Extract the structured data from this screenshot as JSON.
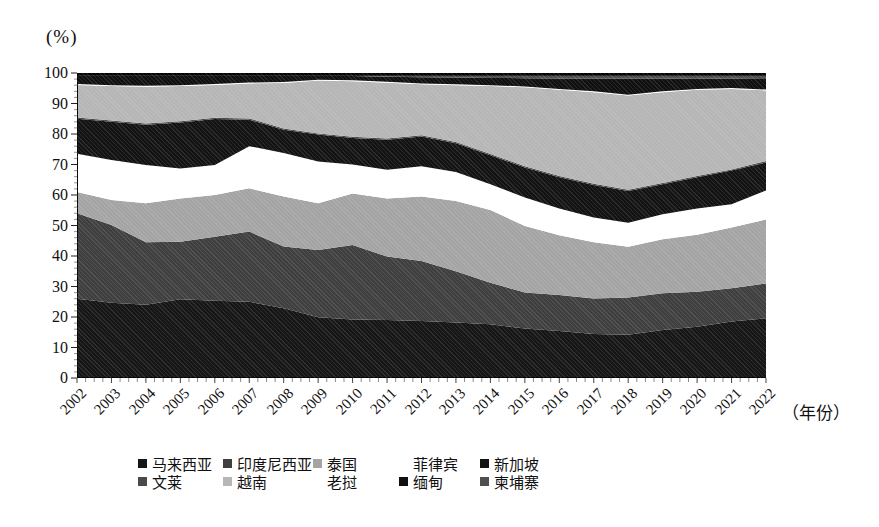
{
  "axis": {
    "y_title": "(%)",
    "x_title": "（年份）",
    "y_ticks": [
      0,
      10,
      20,
      30,
      40,
      50,
      60,
      70,
      80,
      90,
      100
    ],
    "x_ticks": [
      "2002",
      "2003",
      "2004",
      "2005",
      "2006",
      "2007",
      "2008",
      "2009",
      "2010",
      "2011",
      "2012",
      "2013",
      "2014",
      "2015",
      "2016",
      "2017",
      "2018",
      "2019",
      "2020",
      "2021",
      "2022"
    ]
  },
  "legend": {
    "rows": [
      [
        "malaysia",
        "indonesia",
        "thailand",
        "philippines",
        "singapore"
      ],
      [
        "brunei",
        "vietnam",
        "laos",
        "myanmar",
        "cambodia"
      ]
    ]
  },
  "chart_data": {
    "type": "area",
    "stacked": true,
    "stack_total": 100,
    "title": "",
    "xlabel": "（年份）",
    "ylabel": "(%)",
    "ylim": [
      0,
      100
    ],
    "grid": false,
    "legend_position": "bottom",
    "x": [
      2002,
      2003,
      2004,
      2005,
      2006,
      2007,
      2008,
      2009,
      2010,
      2011,
      2012,
      2013,
      2014,
      2015,
      2016,
      2017,
      2018,
      2019,
      2020,
      2021,
      2022
    ],
    "series": [
      {
        "id": "malaysia",
        "name": "马来西亚",
        "color": "#161616",
        "values": [
          26.0,
          24.7,
          24.0,
          25.8,
          25.3,
          25.0,
          22.9,
          19.9,
          19.2,
          19.0,
          18.7,
          18.2,
          17.6,
          16.2,
          15.4,
          14.4,
          14.2,
          15.7,
          16.8,
          18.5,
          19.6
        ]
      },
      {
        "id": "indonesia",
        "name": "印度尼西亚",
        "color": "#3f3f3f",
        "values": [
          28.0,
          25.5,
          20.5,
          18.9,
          21.0,
          23.0,
          20.2,
          22.1,
          24.4,
          20.8,
          19.7,
          16.8,
          13.6,
          11.8,
          11.8,
          11.7,
          12.2,
          12.1,
          11.5,
          10.9,
          11.4
        ]
      },
      {
        "id": "thailand",
        "name": "泰国",
        "color": "#a4a4a4",
        "values": [
          7.0,
          8.2,
          12.8,
          14.2,
          13.7,
          14.2,
          16.4,
          15.3,
          16.9,
          19.1,
          21.1,
          23.0,
          23.9,
          21.8,
          19.6,
          18.4,
          16.6,
          17.7,
          18.7,
          19.9,
          21.0
        ]
      },
      {
        "id": "philippines",
        "name": "菲律宾",
        "color": "#ffffff",
        "values": [
          12.5,
          13.1,
          12.5,
          9.8,
          9.8,
          13.8,
          14.3,
          13.7,
          9.5,
          9.4,
          9.9,
          9.5,
          8.4,
          9.4,
          8.8,
          8.1,
          7.9,
          8.2,
          8.6,
          7.7,
          9.5
        ]
      },
      {
        "id": "singapore",
        "name": "新加坡",
        "color": "#131313",
        "values": [
          11.5,
          12.5,
          13.2,
          15.1,
          15.1,
          8.7,
          7.6,
          8.8,
          8.7,
          9.8,
          9.8,
          9.5,
          9.5,
          9.8,
          10.2,
          10.7,
          10.4,
          9.8,
          10.2,
          11.0,
          9.2
        ]
      },
      {
        "id": "brunei",
        "name": "文莱",
        "color": "#4a4a4a",
        "values": [
          0.4,
          0.4,
          0.4,
          0.4,
          0.4,
          0.4,
          0.4,
          0.4,
          0.4,
          0.4,
          0.4,
          0.4,
          0.4,
          0.4,
          0.4,
          0.4,
          0.4,
          0.4,
          0.4,
          0.4,
          0.4
        ]
      },
      {
        "id": "vietnam",
        "name": "越南",
        "color": "#b6b6b6",
        "values": [
          10.7,
          11.3,
          12.1,
          11.5,
          10.8,
          11.5,
          14.9,
          17.3,
          18.2,
          18.3,
          16.7,
          18.6,
          22.3,
          25.9,
          28.3,
          30.0,
          30.9,
          29.8,
          28.3,
          26.4,
          23.2
        ]
      },
      {
        "id": "laos",
        "name": "老挝",
        "color": "#ffffff",
        "values": [
          0.3,
          0.3,
          0.3,
          0.3,
          0.3,
          0.3,
          0.3,
          0.3,
          0.3,
          0.3,
          0.3,
          0.3,
          0.3,
          0.3,
          0.3,
          0.3,
          0.3,
          0.3,
          0.3,
          0.3,
          0.3
        ]
      },
      {
        "id": "myanmar",
        "name": "缅甸",
        "color": "#101010",
        "values": [
          2.6,
          3.0,
          3.2,
          3.0,
          2.6,
          2.1,
          2.0,
          1.2,
          1.4,
          1.7,
          2.0,
          2.2,
          2.4,
          2.7,
          3.4,
          4.2,
          5.3,
          4.2,
          3.4,
          3.0,
          3.4
        ]
      },
      {
        "id": "cambodia",
        "name": "柬埔寨",
        "color": "#4f4f4f",
        "values": [
          1.0,
          1.0,
          1.0,
          1.0,
          1.0,
          1.0,
          1.0,
          1.0,
          1.0,
          1.2,
          1.4,
          1.5,
          1.6,
          1.7,
          1.8,
          1.8,
          1.8,
          1.8,
          1.8,
          1.9,
          2.0
        ]
      }
    ]
  }
}
